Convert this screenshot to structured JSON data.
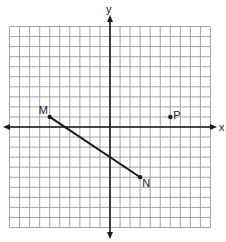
{
  "diagram": {
    "type": "coordinate-grid",
    "grid": {
      "xmin": -10,
      "xmax": 10,
      "ymin": -10,
      "ymax": 10,
      "step": 1
    },
    "axes": {
      "x_label": "x",
      "y_label": "y"
    },
    "points": [
      {
        "name": "M",
        "x": -6,
        "y": 1
      },
      {
        "name": "N",
        "x": 3,
        "y": -5
      },
      {
        "name": "P",
        "x": 6,
        "y": 1
      }
    ],
    "segments": [
      {
        "from": "M",
        "to": "N"
      }
    ],
    "colors": {
      "grid": "#9a9a9a",
      "axes": "#1a1a1a",
      "segment": "#1a1a1a",
      "background": "#ffffff"
    }
  },
  "labels": {
    "x_axis": "x",
    "y_axis": "y",
    "point_m": "M",
    "point_n": "N",
    "point_p": "P"
  }
}
